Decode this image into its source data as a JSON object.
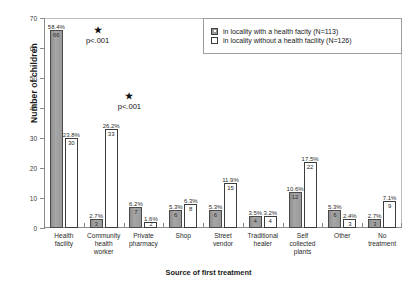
{
  "chart_data": {
    "type": "bar",
    "title": "",
    "xlabel": "Source of first treatment",
    "ylabel": "Number of children",
    "ylim": [
      0,
      70
    ],
    "yticks": [
      0,
      10,
      20,
      30,
      40,
      50,
      60,
      70
    ],
    "grid": false,
    "legend_position": "top-right",
    "categories": [
      "Health\nfacility",
      "Community\nhealth\nworker",
      "Private\npharmacy",
      "Shop",
      "Street\nvendor",
      "Traditional\nhealer",
      "Self\ncollected\nplants",
      "Other",
      "No\ntreatment"
    ],
    "series": [
      {
        "name": "in locality with a health facity (N=113)",
        "style": "filled",
        "values": [
          66,
          3,
          7,
          6,
          6,
          4,
          12,
          6,
          3
        ],
        "percent_labels": [
          "58.4%",
          "2.7%",
          "6.2%",
          "5.3%",
          "5.3%",
          "3.5%",
          "10.6%",
          "5.3%",
          "2.7%"
        ],
        "count_labels": [
          "66",
          "3",
          "7",
          "6",
          "6",
          "4",
          "12",
          "6",
          "3"
        ]
      },
      {
        "name": "in locality without a health facility (N=126)",
        "style": "hollow",
        "values": [
          30,
          33,
          2,
          8,
          15,
          4,
          22,
          3,
          9
        ],
        "percent_labels": [
          "23.8%",
          "26.2%",
          "1.6%",
          "6.3%",
          "11.9%",
          "3.2%",
          "17.5%",
          "2.4%",
          "7.1%"
        ],
        "count_labels": [
          "30",
          "33",
          "2",
          "8",
          "15",
          "4",
          "22",
          "3",
          "9"
        ]
      }
    ],
    "annotations": [
      {
        "star": "★",
        "pvalue": "p<.001",
        "category": "Health facility"
      },
      {
        "star": "★",
        "pvalue": "p<.001",
        "category": "Community health worker"
      }
    ]
  },
  "legend": {
    "items": [
      {
        "label": "in locality with a health facity (N=113)",
        "swatch": "filled-square-icon"
      },
      {
        "label": "in locality without a health facility (N=126)",
        "swatch": "hollow-square-icon"
      }
    ]
  }
}
